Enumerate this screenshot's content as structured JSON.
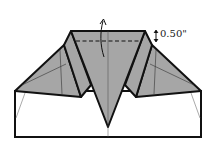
{
  "diagram": {
    "type": "origami-fold-step",
    "measurement_label": "0.50\"",
    "colors": {
      "paper_shaded": "#a6a6a6",
      "paper_white": "#ffffff",
      "outline": "#111111"
    },
    "annotations": [
      {
        "kind": "dashed-fold-line",
        "description": "valley fold line near top edge"
      },
      {
        "kind": "curved-arrow",
        "description": "fold top edge up/back"
      },
      {
        "kind": "dimension-marker",
        "text": "0.50\""
      }
    ]
  }
}
